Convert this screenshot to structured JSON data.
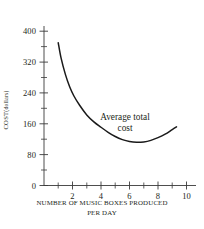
{
  "chart_data": {
    "type": "line",
    "title": "",
    "subtitle": "",
    "xlabel_lines": [
      "NUMBER OF MUSIC BOXES PRODUCED",
      "PER DAY"
    ],
    "xlabel": "NUMBER OF MUSIC BOXES PRODUCED PER DAY",
    "ylabel": "COST (dollars)",
    "ylabel_main": "COST",
    "ylabel_unit": "(dollars)",
    "grid": false,
    "legend": "none",
    "xlim": [
      0,
      10.6
    ],
    "ylim": [
      0,
      430
    ],
    "x_major_ticks": [
      2,
      4,
      6,
      8,
      10
    ],
    "x_minor_ticks": [
      1,
      3,
      5,
      7,
      9
    ],
    "x_tick_labels": [
      "2",
      "4",
      "6",
      "8",
      "10"
    ],
    "y_major_ticks": [
      0,
      80,
      160,
      240,
      320,
      400
    ],
    "y_minor_ticks": [
      40,
      120,
      200,
      280,
      360
    ],
    "y_tick_labels": [
      "0",
      "80",
      "160",
      "240",
      "320",
      "400"
    ],
    "series": [
      {
        "name": "Average total cost",
        "color": "#1a1a1a",
        "x": [
          1.0,
          1.2,
          1.5,
          1.8,
          2.1,
          2.5,
          3.0,
          3.5,
          4.0,
          4.5,
          5.0,
          5.5,
          6.0,
          6.5,
          7.0,
          7.5,
          8.0,
          8.5,
          9.0,
          9.3
        ],
        "y": [
          370,
          330,
          288,
          256,
          232,
          208,
          183,
          165,
          151,
          138,
          127,
          119,
          114,
          112,
          113,
          117,
          124,
          133,
          145,
          152
        ]
      }
    ],
    "annotations": [
      {
        "text": "Average total cost",
        "line1": "Average total",
        "line2": "cost",
        "x": 6.0,
        "y": 175
      }
    ]
  },
  "axis_color": "#3a3a3a"
}
